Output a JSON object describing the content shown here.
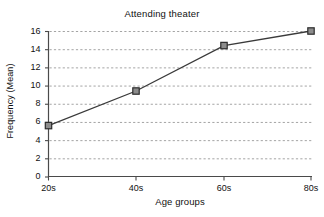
{
  "chart_data": {
    "type": "line",
    "title": "Attending theater",
    "xlabel": "Age groups",
    "ylabel": "Frequency (Mean)",
    "categories": [
      "20s",
      "40s",
      "60s",
      "80s"
    ],
    "values": [
      5.6,
      9.4,
      14.4,
      16.0
    ],
    "series": [
      {
        "name": "Frequency (Mean)",
        "values": [
          5.6,
          9.4,
          14.4,
          16.0
        ]
      }
    ],
    "ylim": [
      0,
      16
    ],
    "yticks": [
      0,
      2,
      4,
      6,
      8,
      10,
      12,
      14,
      16
    ],
    "ytick_labels": [
      "0",
      "2",
      "4",
      "6",
      "8",
      "10",
      "12",
      "14",
      "16"
    ],
    "xtick_labels": [
      "20s",
      "40s",
      "60s",
      "80s"
    ],
    "grid": "horizontal-dashed",
    "legend": "none",
    "marker": "square",
    "marker_fill": "#8c8c8c",
    "marker_edge": "#2b2b2b",
    "line_color": "#3a3a3a",
    "gridline_color": "#9a9a9a",
    "axis_color": "#4a4a4a",
    "background": "#ffffff"
  }
}
